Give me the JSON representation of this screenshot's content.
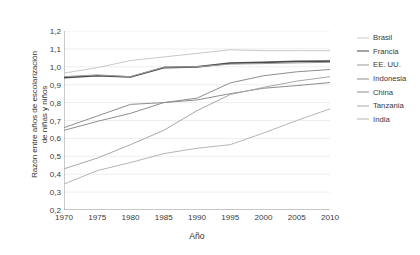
{
  "chart_data": {
    "type": "line",
    "title": "",
    "xlabel": "Año",
    "ylabel": "Razón entre años de escolarización de niñas y niños",
    "ylabel_lines": [
      "Razón entre años de escolarización",
      "de niñas y niños"
    ],
    "x": [
      1970,
      1975,
      1980,
      1985,
      1990,
      1995,
      2000,
      2005,
      2010
    ],
    "xlim": [
      1970,
      2010
    ],
    "ylim": [
      0.2,
      1.2
    ],
    "xticks": [
      1970,
      1975,
      1980,
      1985,
      1990,
      1995,
      2000,
      2005,
      2010
    ],
    "xticklabels": [
      "1970",
      "1975",
      "1980",
      "1985",
      "1990",
      "1995",
      "2000",
      "2005",
      "2010"
    ],
    "yticks": [
      0.2,
      0.3,
      0.4,
      0.5,
      0.6,
      0.7,
      0.8,
      0.9,
      1.0,
      1.1,
      1.2
    ],
    "yticklabels": [
      "0,2",
      "0,3",
      "0,4",
      "0,5",
      "0,6",
      "0,7",
      "0,8",
      "0,9",
      "1,0",
      "1,1",
      "1,2"
    ],
    "grid": "horizontal",
    "legend_position": "right",
    "decimal_separator": ",",
    "series": [
      {
        "name": "Brasil",
        "color": "#c9c9c9",
        "width": 1.0,
        "values": [
          0.965,
          0.995,
          1.035,
          1.055,
          1.075,
          1.095,
          1.09,
          1.09,
          1.09
        ]
      },
      {
        "name": "Francia",
        "color": "#4a4a4a",
        "width": 1.7,
        "values": [
          0.94,
          0.95,
          0.943,
          0.995,
          1.0,
          1.02,
          1.025,
          1.03,
          1.032
        ]
      },
      {
        "name": "EE. UU.",
        "color": "#9a9a9a",
        "width": 1.0,
        "values": [
          0.945,
          0.955,
          0.945,
          0.998,
          1.0,
          1.015,
          1.018,
          1.022,
          1.025
        ]
      },
      {
        "name": "Indonesia",
        "color": "#8e8e8e",
        "width": 1.0,
        "values": [
          0.66,
          0.725,
          0.79,
          0.8,
          0.825,
          0.91,
          0.95,
          0.972,
          0.985
        ]
      },
      {
        "name": "China",
        "color": "#8e8e8e",
        "width": 1.0,
        "values": [
          0.645,
          0.695,
          0.74,
          0.8,
          0.815,
          0.85,
          0.88,
          0.895,
          0.912
        ]
      },
      {
        "name": "Tanzania",
        "color": "#a8a8a8",
        "width": 1.0,
        "values": [
          0.43,
          0.49,
          0.565,
          0.645,
          0.755,
          0.845,
          0.885,
          0.92,
          0.945
        ]
      },
      {
        "name": "India",
        "color": "#b5b5b5",
        "width": 1.0,
        "values": [
          0.345,
          0.42,
          0.465,
          0.515,
          0.545,
          0.565,
          0.63,
          0.7,
          0.765
        ]
      }
    ]
  },
  "legend": {
    "items": [
      {
        "label": "Brasil"
      },
      {
        "label": "Francia"
      },
      {
        "label": "EE. UU."
      },
      {
        "label": "Indonesia"
      },
      {
        "label": "China"
      },
      {
        "label": "Tanzania"
      },
      {
        "label": "India"
      }
    ]
  }
}
